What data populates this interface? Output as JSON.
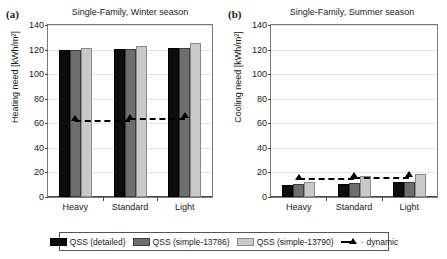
{
  "figure": {
    "panels": [
      {
        "letter": "(a)",
        "title": "Single-Family, Winter season",
        "ylabel": "Heating need [kWh/m²]"
      },
      {
        "letter": "(b)",
        "title": "Single-Family, Summer season",
        "ylabel": "Cooling need [kWh/m²]"
      }
    ],
    "legend": {
      "items": [
        {
          "label": "QSS (detailed)",
          "marker": "filled-square-black"
        },
        {
          "label": "QSS (simple-13786)",
          "marker": "filled-square-darkgray"
        },
        {
          "label": "QSS (simple-13790)",
          "marker": "filled-square-lightgray"
        },
        {
          "label": "dynamic",
          "marker": "dashed-line-triangle"
        }
      ]
    },
    "colors": {
      "qss_detailed": "#0d0d0d",
      "qss_simple_13786": "#6e6e6e",
      "qss_simple_13790": "#c9c9c9",
      "dynamic": "#000000",
      "gridline": "#e3e3e3",
      "axis": "#4a4a4a"
    }
  },
  "chart_data": [
    {
      "type": "bar",
      "title": "Single-Family, Winter season",
      "panel": "(a)",
      "xlabel": "",
      "ylabel": "Heating need [kWh/m²]",
      "ylim": [
        0,
        140
      ],
      "yticks": [
        0,
        20,
        40,
        60,
        80,
        100,
        120,
        140
      ],
      "ytick_labels": [
        "0",
        "20",
        "40",
        "60",
        "80",
        "100",
        "120",
        "140"
      ],
      "grid": true,
      "legend_position": "below-figure",
      "categories": [
        "Heavy",
        "Standard",
        "Light"
      ],
      "series": [
        {
          "name": "QSS (detailed)",
          "values": [
            119.5,
            120.5,
            121.5
          ]
        },
        {
          "name": "QSS (simple-13786)",
          "values": [
            119.5,
            120.5,
            121.5
          ]
        },
        {
          "name": "QSS (simple-13790)",
          "values": [
            121.0,
            123.0,
            125.0
          ]
        },
        {
          "name": "dynamic",
          "type": "line",
          "values": [
            62.5,
            63.5,
            65.0
          ]
        }
      ]
    },
    {
      "type": "bar",
      "title": "Single-Family, Summer season",
      "panel": "(b)",
      "xlabel": "",
      "ylabel": "Cooling need [kWh/m²]",
      "ylim": [
        0,
        140
      ],
      "yticks": [
        0,
        20,
        40,
        60,
        80,
        100,
        120,
        140
      ],
      "ytick_labels": [
        "0",
        "20",
        "40",
        "60",
        "80",
        "100",
        "120",
        "140"
      ],
      "grid": true,
      "legend_position": "below-figure",
      "categories": [
        "Heavy",
        "Standard",
        "Light"
      ],
      "series": [
        {
          "name": "QSS (detailed)",
          "values": [
            10.0,
            11.0,
            12.5
          ]
        },
        {
          "name": "QSS (simple-13786)",
          "values": [
            10.5,
            11.5,
            12.5
          ]
        },
        {
          "name": "QSS (simple-13790)",
          "values": [
            12.5,
            17.0,
            19.0
          ]
        },
        {
          "name": "dynamic",
          "type": "line",
          "values": [
            15.0,
            16.0,
            17.0
          ]
        }
      ]
    }
  ]
}
